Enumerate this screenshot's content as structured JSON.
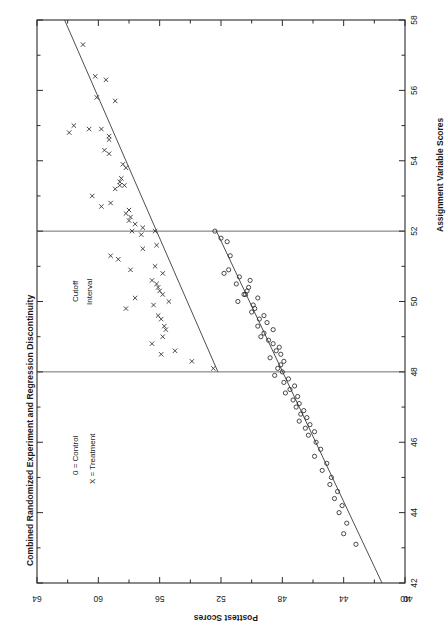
{
  "figure": {
    "title": "Combined Randomized Experiment and Regression Discontinuity",
    "orientation": "rotated-90",
    "background": "#ffffff",
    "ink": "#1a1a1a"
  },
  "axes": {
    "bottom": {
      "label": "Posttest Scores",
      "ticks": [
        64,
        60,
        56,
        52,
        48,
        44,
        40
      ],
      "tick_labels": [
        "64",
        "60",
        "56",
        "52",
        "48",
        "44",
        "40"
      ],
      "range": [
        64,
        40
      ],
      "direction": "descending-left-to-right"
    },
    "right": {
      "label": "Assignment Variable Scores",
      "ticks": [
        58,
        56,
        54,
        52,
        50,
        48,
        46,
        44,
        42
      ],
      "tick_labels": [
        "58",
        "56",
        "54",
        "52",
        "50",
        "48",
        "46",
        "44",
        "42"
      ],
      "range": [
        58,
        42
      ],
      "direction": "descending-top-to-bottom"
    }
  },
  "annotations": {
    "cutoff_line_1": "Cutoff",
    "cutoff_line_2": "Interval",
    "cutoff_values": [
      52,
      48
    ]
  },
  "legend": {
    "entries": [
      {
        "symbol": "0",
        "text": "0 = Control"
      },
      {
        "symbol": "X",
        "text": "X = Treatment"
      }
    ]
  },
  "chart_data": {
    "type": "scatter",
    "title": "Combined Randomized Experiment and Regression Discontinuity",
    "xlabel": "Assignment Variable Scores",
    "ylabel": "Posttest Scores",
    "xlim": [
      42,
      58
    ],
    "ylim": [
      40,
      64
    ],
    "grid": false,
    "legend_position": "left-middle",
    "cutoff_lines": [
      52,
      48
    ],
    "cutoff_label": "Cutoff Interval",
    "series": [
      {
        "name": "Treatment",
        "marker": "x",
        "points": [
          [
            57.3,
            61.0
          ],
          [
            56.4,
            60.2
          ],
          [
            56.3,
            59.5
          ],
          [
            55.8,
            60.1
          ],
          [
            55.7,
            58.9
          ],
          [
            55.0,
            61.6
          ],
          [
            54.9,
            60.6
          ],
          [
            54.9,
            59.8
          ],
          [
            54.8,
            61.9
          ],
          [
            54.7,
            59.3
          ],
          [
            54.6,
            59.3
          ],
          [
            54.3,
            59.6
          ],
          [
            54.2,
            59.3
          ],
          [
            53.9,
            58.4
          ],
          [
            53.8,
            58.2
          ],
          [
            53.5,
            58.5
          ],
          [
            53.4,
            58.6
          ],
          [
            53.3,
            58.6
          ],
          [
            53.3,
            58.3
          ],
          [
            53.2,
            58.9
          ],
          [
            53.0,
            60.4
          ],
          [
            52.8,
            59.2
          ],
          [
            52.7,
            59.8
          ],
          [
            52.6,
            58.0
          ],
          [
            52.5,
            58.2
          ],
          [
            52.4,
            57.9
          ],
          [
            52.3,
            58.0
          ],
          [
            52.2,
            57.6
          ],
          [
            52.1,
            57.1
          ],
          [
            52.0,
            57.8
          ],
          [
            52.0,
            56.3
          ],
          [
            51.9,
            57.2
          ],
          [
            51.6,
            56.2
          ],
          [
            51.5,
            57.1
          ],
          [
            51.3,
            59.2
          ],
          [
            51.2,
            58.7
          ],
          [
            51.0,
            56.3
          ],
          [
            50.9,
            57.9
          ],
          [
            50.8,
            55.8
          ],
          [
            50.6,
            56.5
          ],
          [
            50.5,
            56.2
          ],
          [
            50.4,
            56.1
          ],
          [
            50.3,
            56.0
          ],
          [
            50.2,
            55.8
          ],
          [
            50.1,
            57.6
          ],
          [
            50.0,
            55.4
          ],
          [
            49.9,
            56.4
          ],
          [
            49.8,
            58.2
          ],
          [
            49.6,
            56.1
          ],
          [
            49.5,
            55.9
          ],
          [
            49.3,
            55.7
          ],
          [
            49.2,
            55.6
          ],
          [
            49.0,
            55.8
          ],
          [
            48.8,
            56.5
          ],
          [
            48.6,
            55.0
          ],
          [
            48.5,
            55.9
          ],
          [
            48.3,
            53.9
          ],
          [
            48.1,
            52.5
          ]
        ]
      },
      {
        "name": "Control",
        "marker": "o",
        "points": [
          [
            52.0,
            52.4
          ],
          [
            51.8,
            52.0
          ],
          [
            51.7,
            51.6
          ],
          [
            51.3,
            51.4
          ],
          [
            50.9,
            51.5
          ],
          [
            50.8,
            51.8
          ],
          [
            50.7,
            50.8
          ],
          [
            50.6,
            50.1
          ],
          [
            50.5,
            51.0
          ],
          [
            50.4,
            50.2
          ],
          [
            50.3,
            50.3
          ],
          [
            50.2,
            50.5
          ],
          [
            50.2,
            50.4
          ],
          [
            50.1,
            49.6
          ],
          [
            50.0,
            50.9
          ],
          [
            49.9,
            49.9
          ],
          [
            49.8,
            49.8
          ],
          [
            49.7,
            50.0
          ],
          [
            49.6,
            49.2
          ],
          [
            49.5,
            49.5
          ],
          [
            49.4,
            49.0
          ],
          [
            49.3,
            49.6
          ],
          [
            49.2,
            48.6
          ],
          [
            49.1,
            49.2
          ],
          [
            49.0,
            49.4
          ],
          [
            48.9,
            48.9
          ],
          [
            48.8,
            48.6
          ],
          [
            48.7,
            48.2
          ],
          [
            48.6,
            48.4
          ],
          [
            48.5,
            48.1
          ],
          [
            48.4,
            48.8
          ],
          [
            48.3,
            47.9
          ],
          [
            48.2,
            48.1
          ],
          [
            48.1,
            48.3
          ],
          [
            48.0,
            48.0
          ],
          [
            47.9,
            48.5
          ],
          [
            47.8,
            47.6
          ],
          [
            47.7,
            47.9
          ],
          [
            47.6,
            47.2
          ],
          [
            47.5,
            47.5
          ],
          [
            47.4,
            47.8
          ],
          [
            47.3,
            47.0
          ],
          [
            47.2,
            47.3
          ],
          [
            47.1,
            46.9
          ],
          [
            47.0,
            47.1
          ],
          [
            46.9,
            46.6
          ],
          [
            46.8,
            46.8
          ],
          [
            46.7,
            46.4
          ],
          [
            46.6,
            46.9
          ],
          [
            46.5,
            46.2
          ],
          [
            46.4,
            46.5
          ],
          [
            46.3,
            45.9
          ],
          [
            46.2,
            46.3
          ],
          [
            46.0,
            45.8
          ],
          [
            45.8,
            45.5
          ],
          [
            45.6,
            45.9
          ],
          [
            45.4,
            45.1
          ],
          [
            45.2,
            45.4
          ],
          [
            45.0,
            44.8
          ],
          [
            44.8,
            44.9
          ],
          [
            44.6,
            44.4
          ],
          [
            44.4,
            44.6
          ],
          [
            44.2,
            44.1
          ],
          [
            44.0,
            44.3
          ],
          [
            43.7,
            43.8
          ],
          [
            43.4,
            44.0
          ],
          [
            43.1,
            43.2
          ]
        ]
      }
    ],
    "regression_lines": [
      {
        "name": "Treatment fit",
        "from": [
          58.0,
          62.2
        ],
        "to": [
          48.0,
          52.2
        ]
      },
      {
        "name": "Control fit",
        "from": [
          52.0,
          52.3
        ],
        "to": [
          42.0,
          41.5
        ]
      }
    ]
  }
}
